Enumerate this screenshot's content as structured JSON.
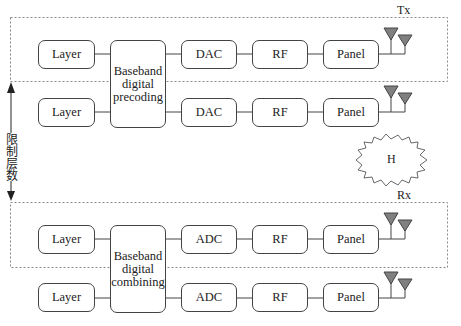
{
  "tx": {
    "label": "Tx",
    "rows": [
      {
        "layer": "Layer",
        "converter": "DAC",
        "rf": "RF",
        "panel": "Panel"
      },
      {
        "layer": "Layer",
        "converter": "DAC",
        "rf": "RF",
        "panel": "Panel"
      }
    ],
    "baseband": "Baseband digital precoding"
  },
  "rx": {
    "label": "Rx",
    "rows": [
      {
        "layer": "Layer",
        "converter": "ADC",
        "rf": "RF",
        "panel": "Panel"
      },
      {
        "layer": "Layer",
        "converter": "ADC",
        "rf": "RF",
        "panel": "Panel"
      }
    ],
    "baseband": "Baseband digital combining"
  },
  "channel": {
    "label": "H"
  },
  "side_label": "限制层数",
  "colors": {
    "antenna": "#808080",
    "line": "#444444",
    "dashed": "#888888"
  }
}
